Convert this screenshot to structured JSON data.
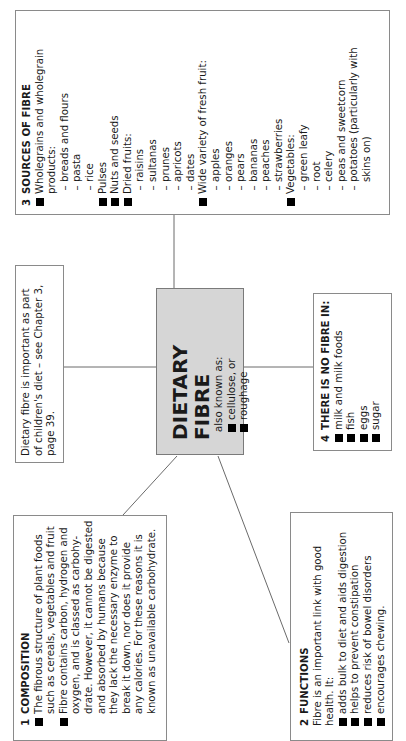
{
  "orientation": "rotated -90deg (text reads bottom-to-top)",
  "center": {
    "title": "DIETARY FIBRE",
    "subtitle": "also known as:",
    "aliases": [
      "cellulose, or",
      "roughage"
    ],
    "fill_color": "#d6d6d6"
  },
  "note": {
    "lines": [
      "Dietary fibre is important as part",
      "of children's diet – see Chapter 3,",
      "page 39."
    ]
  },
  "composition": {
    "number": "1",
    "heading": "COMPOSITION",
    "bullets": [
      {
        "lines": [
          "The fibrous structure of plant foods",
          "such as cereals, vegetables and fruit"
        ]
      },
      {
        "lines": [
          "Fibre contains carbon, hydrogen and",
          "oxygen, and is classed as carbohy-",
          "drate. However, it cannot be digested",
          "and absorbed by humans because",
          "they lack the necessary enzyme to",
          "break it down, nor does it provide",
          "any calories. For these reasons it is",
          "known as unavailable carbohydrate."
        ]
      }
    ]
  },
  "functions": {
    "number": "2",
    "heading": "FUNCTIONS",
    "intro": [
      "Fibre is an important link with good",
      "health. It:"
    ],
    "bullets": [
      "adds bulk to diet and aids digestion",
      "helps to prevent constipation",
      "reduces risk of bowel disorders",
      "encourages chewing."
    ]
  },
  "sources": {
    "number": "3",
    "heading": "SOURCES OF FIBRE",
    "rows": [
      {
        "type": "bullet",
        "text": "Wholegrains and wholegrain"
      },
      {
        "type": "cont",
        "text": "products:"
      },
      {
        "type": "dash",
        "text": "breads and flours"
      },
      {
        "type": "dash",
        "text": "pasta"
      },
      {
        "type": "dash",
        "text": "rice"
      },
      {
        "type": "bullet",
        "text": "Pulses"
      },
      {
        "type": "bullet",
        "text": "Nuts and seeds"
      },
      {
        "type": "bullet",
        "text": "Dried fruits:"
      },
      {
        "type": "dash",
        "text": "raisins"
      },
      {
        "type": "dash",
        "text": "sultanas"
      },
      {
        "type": "dash",
        "text": "prunes"
      },
      {
        "type": "dash",
        "text": "apricots"
      },
      {
        "type": "dash",
        "text": "dates"
      },
      {
        "type": "bullet",
        "text": "Wide variety of fresh fruit:"
      },
      {
        "type": "dash",
        "text": "apples"
      },
      {
        "type": "dash",
        "text": "oranges"
      },
      {
        "type": "dash",
        "text": "pears"
      },
      {
        "type": "dash",
        "text": "bananas"
      },
      {
        "type": "dash",
        "text": "peaches"
      },
      {
        "type": "dash",
        "text": "strawberries"
      },
      {
        "type": "bullet",
        "text": "Vegetables:"
      },
      {
        "type": "dash",
        "text": "green leafy"
      },
      {
        "type": "dash",
        "text": "root"
      },
      {
        "type": "dash",
        "text": "celery"
      },
      {
        "type": "dash",
        "text": "peas and sweetcorn"
      },
      {
        "type": "dash",
        "text": "potatoes (particularly with"
      },
      {
        "type": "dashcont",
        "text": "skins on)"
      }
    ]
  },
  "no_fibre": {
    "number": "4",
    "heading": "THERE IS NO FIBRE IN:",
    "bullets": [
      "milk and milk foods",
      "fish",
      "eggs",
      "sugar"
    ]
  },
  "symbols": {
    "bullet": "■",
    "dash": "–"
  }
}
